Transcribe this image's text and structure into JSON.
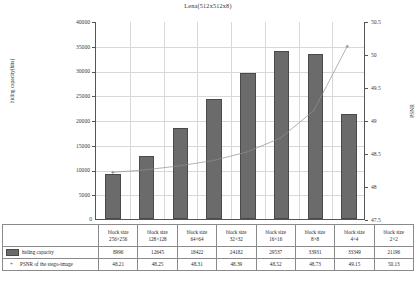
{
  "chart_data": {
    "type": "bar",
    "title": "Lena(512x512x8)",
    "xlabel": "",
    "ylabel": "hiding capacity(bits)",
    "y2label": "PSNR",
    "ylim": [
      0,
      40000
    ],
    "y2lim": [
      47.5,
      50.5
    ],
    "grid": true,
    "legend_position": "table-below",
    "categories": [
      "block size 256×256",
      "block size 128×128",
      "block size 64×64",
      "block size 32×32",
      "block size 16×16",
      "block size 8×8",
      "block size 4×4",
      "block size 2×2"
    ],
    "yticks": [
      "0",
      "5000",
      "10000",
      "15000",
      "20000",
      "25000",
      "30000",
      "35000",
      "40000"
    ],
    "y2ticks": [
      "47.5",
      "48",
      "48.5",
      "49",
      "49.5",
      "50",
      "50.5"
    ],
    "series": [
      {
        "name": "hiding capacity",
        "type": "bar",
        "axis": "left",
        "color": "#6b6b6b",
        "values": [
          8996,
          12645,
          18422,
          24182,
          29537,
          33931,
          33349,
          21196
        ]
      },
      {
        "name": "PSNR of the stego-image",
        "type": "line",
        "axis": "right",
        "color": "#909090",
        "marker": "+",
        "values": [
          48.21,
          48.25,
          48.31,
          48.39,
          48.52,
          48.73,
          49.15,
          50.13
        ]
      }
    ]
  },
  "title": "Lena(512x512x8)",
  "axes": {
    "left_title": "hiding capacity(bits)",
    "right_title": "PSNR",
    "zero_label": "0"
  },
  "table": {
    "category_labels_line1": [
      "block size",
      "block size",
      "block size",
      "block size",
      "block size",
      "block size",
      "block size",
      "block size"
    ],
    "category_labels_line2": [
      "256×256",
      "128×128",
      "64×64",
      "32×32",
      "16×16",
      "8×8",
      "4×4",
      "2×2"
    ],
    "rows": [
      {
        "label": "hiding capacity",
        "marker": "swatch",
        "values": [
          "8996",
          "12645",
          "18422",
          "24182",
          "29537",
          "33931",
          "33349",
          "21196"
        ]
      },
      {
        "label": "PSNR of the stego-image",
        "marker": "plus",
        "marker_glyph": "+",
        "values": [
          "48.21",
          "48.25",
          "48.31",
          "48.39",
          "48.52",
          "48.73",
          "49.15",
          "50.13"
        ]
      }
    ]
  },
  "colors": {
    "bar": "#6b6b6b",
    "bar_border": "#4a4a4a",
    "line": "#909090",
    "grid": "#d8d8d8",
    "axis": "#555555"
  }
}
